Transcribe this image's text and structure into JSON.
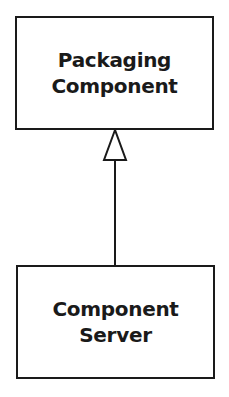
{
  "diagram": {
    "type": "uml-generalization",
    "nodes": [
      {
        "id": "packaging-component",
        "lines": [
          "Packaging",
          "Component"
        ]
      },
      {
        "id": "component-server",
        "lines": [
          "Component",
          "Server"
        ]
      }
    ],
    "edges": [
      {
        "from": "component-server",
        "to": "packaging-component",
        "arrow": "hollow-triangle"
      }
    ]
  }
}
